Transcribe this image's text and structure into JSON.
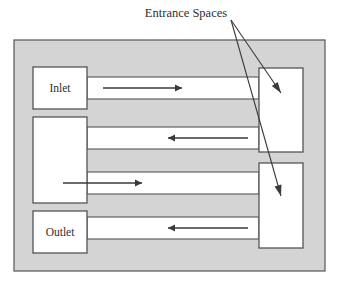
{
  "diagram": {
    "title_label": "Entrance Spaces",
    "colors": {
      "background": "#ffffff",
      "vessel_fill": "#d4d4d4",
      "channel_fill": "#ffffff",
      "box_fill": "#ffffff",
      "stroke": "#555555",
      "text": "#2e2e2e"
    },
    "callout": {
      "label": "Entrance Spaces",
      "origin": {
        "x": 231,
        "y": 20
      },
      "targets": [
        {
          "name": "upper-entrance-space",
          "x": 281,
          "y": 93
        },
        {
          "name": "lower-entrance-space",
          "x": 281,
          "y": 196
        }
      ]
    },
    "vessel": {
      "name": "outer-vessel",
      "x": 14,
      "y": 40,
      "width": 311,
      "height": 231
    },
    "left_boxes": [
      {
        "name": "inlet-box",
        "label": "Inlet",
        "x": 33,
        "y": 67,
        "width": 54,
        "height": 42
      },
      {
        "name": "middle-box",
        "label": "",
        "x": 33,
        "y": 117,
        "width": 54,
        "height": 86
      },
      {
        "name": "outlet-box",
        "label": "Outlet",
        "x": 33,
        "y": 211,
        "width": 54,
        "height": 42
      }
    ],
    "right_boxes": [
      {
        "name": "upper-entrance-space",
        "label": "",
        "x": 259,
        "y": 68,
        "width": 44,
        "height": 84
      },
      {
        "name": "lower-entrance-space",
        "label": "",
        "x": 259,
        "y": 163,
        "width": 44,
        "height": 85
      }
    ],
    "channels": [
      {
        "name": "channel-inlet-to-upper",
        "direction": "right",
        "x": 87,
        "y": 77,
        "width": 172,
        "height": 22,
        "arrow": {
          "x1": 103,
          "x2": 182,
          "y": 88
        }
      },
      {
        "name": "channel-upper-to-middle",
        "direction": "left",
        "x": 87,
        "y": 127,
        "width": 172,
        "height": 22,
        "arrow": {
          "x1": 248,
          "x2": 168,
          "y": 138
        }
      },
      {
        "name": "channel-middle-to-lower",
        "direction": "right",
        "x": 87,
        "y": 172,
        "width": 172,
        "height": 22,
        "arrow": {
          "x1": 63,
          "x2": 142,
          "y": 183
        }
      },
      {
        "name": "channel-lower-to-outlet",
        "direction": "left",
        "x": 87,
        "y": 217,
        "width": 172,
        "height": 22,
        "arrow": {
          "x1": 248,
          "x2": 168,
          "y": 228
        }
      }
    ]
  }
}
